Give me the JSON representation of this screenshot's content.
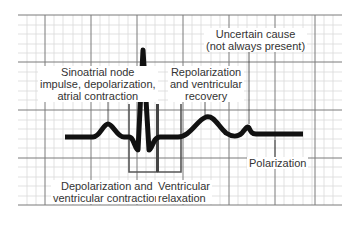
{
  "diagram": {
    "type": "ecg-waveform",
    "colors": {
      "grid_minor": "#d6d6d6",
      "grid_major": "#7a7a7a",
      "trace": "#111111",
      "label_text": "#333333",
      "background": "#ffffff"
    },
    "labels": {
      "p_wave": [
        "Sinoatrial node",
        "impulse, depolarization,",
        "atrial contraction"
      ],
      "t_wave": [
        "Repolarization",
        "and ventricular",
        "recovery"
      ],
      "u_wave": [
        "Uncertain cause",
        "(not always present)"
      ],
      "qrs": [
        "Depolarization and",
        "ventricular contraction"
      ],
      "st": [
        "Ventricular",
        "relaxation"
      ],
      "baseline": [
        "Polarization"
      ]
    }
  }
}
